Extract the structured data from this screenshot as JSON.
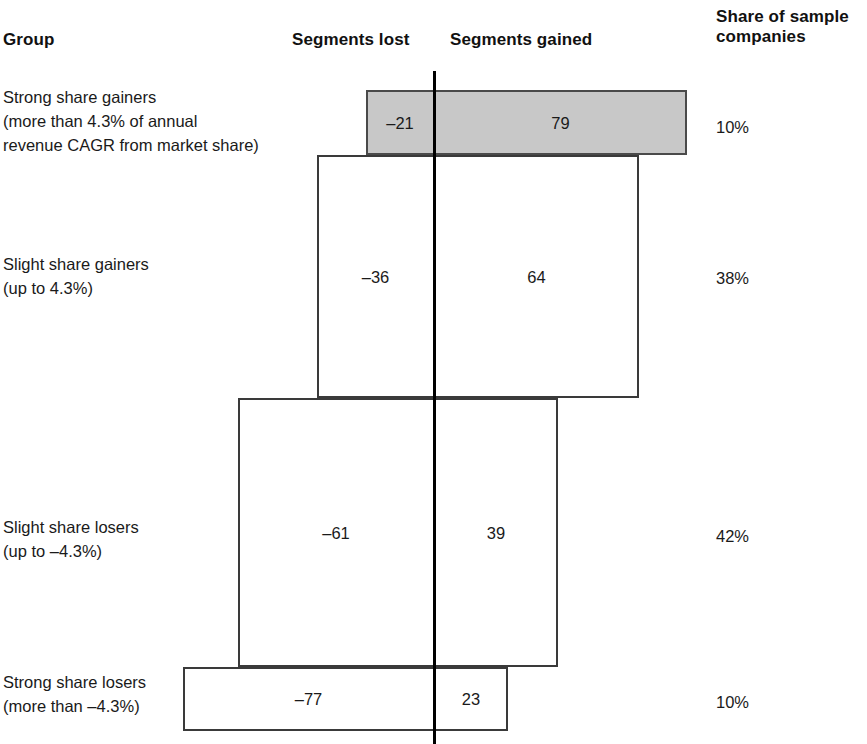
{
  "headers": {
    "group": "Group",
    "segments_lost": "Segments lost",
    "segments_gained": "Segments gained",
    "share_of_sample": "Share of sample\ncompanies"
  },
  "rows": [
    {
      "label": "Strong share gainers\n(more than 4.3% of annual\nrevenue CAGR from market share)",
      "lost_label": "–21",
      "gained_label": "79",
      "share_label": "10%"
    },
    {
      "label": "Slight share gainers\n(up to 4.3%)",
      "lost_label": "–36",
      "gained_label": "64",
      "share_label": "38%"
    },
    {
      "label": "Slight share losers\n(up to –4.3%)",
      "lost_label": "–61",
      "gained_label": "39",
      "share_label": "42%"
    },
    {
      "label": "Strong share losers\n(more than –4.3%)",
      "lost_label": "–77",
      "gained_label": "23",
      "share_label": "10%"
    }
  ],
  "chart_data": {
    "type": "bar",
    "orientation": "horizontal-diverging-marimekko",
    "title": "",
    "xlabel": "",
    "ylabel": "",
    "grid": false,
    "legend": "none",
    "axis_zero": 0,
    "xlim": [
      -100,
      100
    ],
    "categories": [
      "Strong share gainers (more than 4.3% of annual revenue CAGR from market share)",
      "Slight share gainers (up to 4.3%)",
      "Slight share losers (up to -4.3%)",
      "Strong share losers (more than -4.3%)"
    ],
    "series": [
      {
        "name": "Segments lost",
        "values": [
          -21,
          -36,
          -61,
          -77
        ]
      },
      {
        "name": "Segments gained",
        "values": [
          79,
          64,
          39,
          23
        ]
      }
    ],
    "bar_thickness_series": {
      "name": "Share of sample companies",
      "unit": "%",
      "values": [
        10,
        38,
        42,
        10
      ]
    },
    "annotations": [
      "Bar widths encode segments lost (left of zero axis) and segments gained (right of zero axis).",
      "Bar heights encode share of sample companies.",
      "Top bar (Strong share gainers) is filled gray; remaining bars are unfilled."
    ]
  },
  "style": {
    "shaded_fill": "#c8c8c8",
    "bar_stroke": "#3a3a3a",
    "axis_color": "#000000",
    "text_color": "#1a1a1a"
  },
  "geometry": {
    "axis_x": 434,
    "axis_top": 71,
    "axis_bottom": 744,
    "bars": [
      {
        "left": 366,
        "right": 687,
        "top": 90,
        "bottom": 155,
        "shaded": true
      },
      {
        "left": 317,
        "right": 639,
        "top": 155,
        "bottom": 398,
        "shaded": false
      },
      {
        "left": 238,
        "right": 558,
        "top": 398,
        "bottom": 667,
        "shaded": false
      },
      {
        "left": 183,
        "right": 508,
        "top": 667,
        "bottom": 731,
        "shaded": false
      }
    ],
    "label_tops": [
      85,
      252,
      515,
      670
    ],
    "share_tops": [
      117,
      268,
      526,
      692
    ]
  }
}
